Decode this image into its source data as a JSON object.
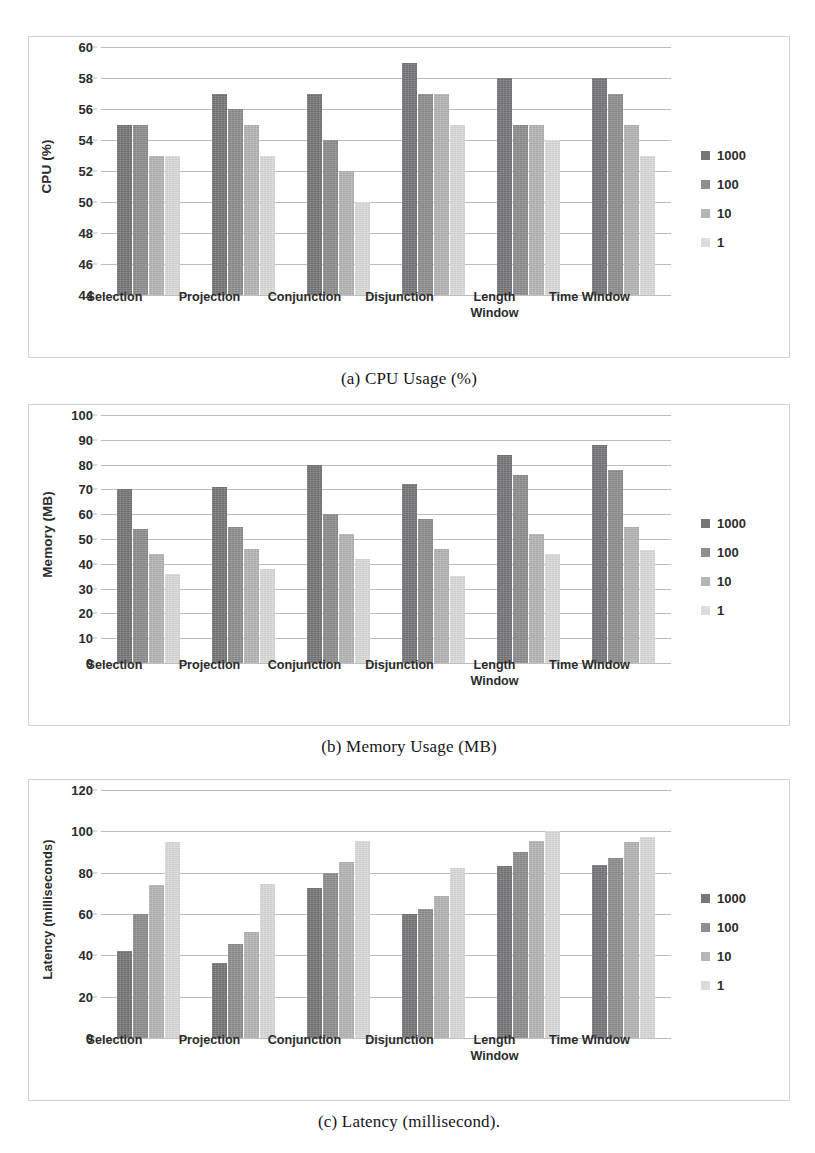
{
  "document": {
    "top_cut_text": "",
    "series_colors": [
      "#77777a",
      "#8e8e90",
      "#b6b6b7",
      "#dcdcdc"
    ]
  },
  "legend": {
    "items": [
      {
        "label": "1000",
        "color": "#77777a",
        "swatch": "legend-swatch-1000"
      },
      {
        "label": "100",
        "color": "#8e8e90",
        "swatch": "legend-swatch-100"
      },
      {
        "label": "10",
        "color": "#b6b6b7",
        "swatch": "legend-swatch-10"
      },
      {
        "label": "1",
        "color": "#dcdcdc",
        "swatch": "legend-swatch-1"
      }
    ]
  },
  "captions": {
    "a": "(a) CPU Usage (%)",
    "b": "(b) Memory Usage (MB)",
    "c": "(c) Latency (millisecond)."
  },
  "chart_data": [
    {
      "id": "cpu",
      "type": "bar",
      "title": "(a) CPU Usage (%)",
      "xlabel": "",
      "ylabel": "CPU (%)",
      "ylim": [
        44,
        60
      ],
      "yticks": [
        44,
        46,
        48,
        50,
        52,
        54,
        56,
        58,
        60
      ],
      "ytick_labels": [
        "44",
        "46",
        "48",
        "50",
        "52",
        "54",
        "56",
        "58",
        "60"
      ],
      "grid": true,
      "legend_position": "right",
      "categories": [
        "Selection",
        "Projection",
        "Conjunction",
        "Disjunction",
        "Length\nWindow",
        "Time Window"
      ],
      "series": [
        {
          "name": "1000",
          "values": [
            55,
            57,
            57,
            59,
            58,
            58
          ]
        },
        {
          "name": "100",
          "values": [
            55,
            56,
            54,
            57,
            55,
            57
          ]
        },
        {
          "name": "10",
          "values": [
            53,
            55,
            52,
            57,
            55,
            55
          ]
        },
        {
          "name": "1",
          "values": [
            53,
            53,
            50,
            55,
            54,
            53
          ]
        }
      ]
    },
    {
      "id": "memory",
      "type": "bar",
      "title": "(b) Memory Usage (MB)",
      "xlabel": "",
      "ylabel": "Memory (MB)",
      "ylim": [
        0,
        100
      ],
      "yticks": [
        0,
        10,
        20,
        30,
        40,
        50,
        60,
        70,
        80,
        90,
        100
      ],
      "ytick_labels": [
        "0",
        "10",
        "20",
        "30",
        "40",
        "50",
        "60",
        "70",
        "80",
        "90",
        "100"
      ],
      "grid": true,
      "legend_position": "right",
      "categories": [
        "Selection",
        "Projection",
        "Conjunction",
        "Disjunction",
        "Length\nWindow",
        "Time Window"
      ],
      "series": [
        {
          "name": "1000",
          "values": [
            70,
            71,
            80,
            72,
            84,
            88
          ]
        },
        {
          "name": "100",
          "values": [
            54,
            55,
            60,
            58,
            76,
            78
          ]
        },
        {
          "name": "10",
          "values": [
            44,
            46,
            52,
            46,
            52,
            55
          ]
        },
        {
          "name": "1",
          "values": [
            36,
            38,
            42,
            35,
            44,
            45.5
          ]
        }
      ]
    },
    {
      "id": "latency",
      "type": "bar",
      "title": "(c) Latency (millisecond).",
      "xlabel": "",
      "ylabel": "Latency (milliseconds)",
      "ylim": [
        0,
        120
      ],
      "yticks": [
        0,
        20,
        40,
        60,
        80,
        100,
        120
      ],
      "ytick_labels": [
        "0",
        "20",
        "40",
        "60",
        "80",
        "100",
        "120"
      ],
      "grid": true,
      "legend_position": "right",
      "categories": [
        "Selection",
        "Projection",
        "Conjunction",
        "Disjunction",
        "Length\nWindow",
        "Time Window"
      ],
      "series": [
        {
          "name": "1000",
          "values": [
            42,
            36.5,
            72.5,
            60,
            83,
            83.5
          ]
        },
        {
          "name": "100",
          "values": [
            60,
            45.5,
            80,
            62.5,
            90,
            87
          ]
        },
        {
          "name": "10",
          "values": [
            74,
            51.5,
            85,
            68.5,
            95.5,
            95
          ]
        },
        {
          "name": "1",
          "values": [
            95,
            74.5,
            95.5,
            82.5,
            100,
            97.5
          ]
        }
      ]
    }
  ]
}
